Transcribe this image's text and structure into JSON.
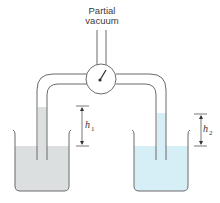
{
  "title": {
    "line1": "Partial",
    "line2": "vacuum"
  },
  "labels": {
    "h1": {
      "symbol": "h",
      "subscript": "1"
    },
    "h2": {
      "symbol": "h",
      "subscript": "2"
    }
  },
  "components": {
    "gauge": "pressure-gauge",
    "left_beaker": {
      "liquid": "gray liquid",
      "liquid_color": "#dcdfe0"
    },
    "right_beaker": {
      "liquid": "light blue liquid",
      "liquid_color": "#d6eef5"
    }
  },
  "colors": {
    "stroke": "#6b6b6b",
    "left_liquid": "#dcdfe0",
    "right_liquid": "#d6eef5"
  }
}
